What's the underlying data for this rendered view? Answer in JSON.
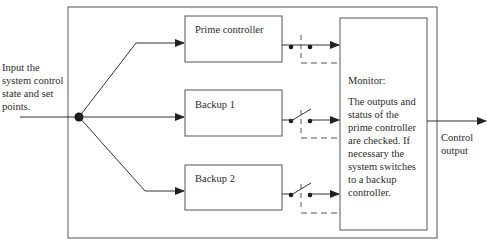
{
  "diagram": {
    "input_label": [
      "Input the",
      "system control",
      "state and set",
      "points."
    ],
    "controllers": [
      {
        "label": "Prime controller",
        "switch_state": "closed"
      },
      {
        "label": "Backup 1",
        "switch_state": "open"
      },
      {
        "label": "Backup 2",
        "switch_state": "open"
      }
    ],
    "monitor": {
      "title": "Monitor:",
      "description": [
        "The outputs and",
        "status of the",
        "prime controller",
        "are checked. If",
        "necessary the",
        "system switches",
        "to a backup",
        "controller."
      ]
    },
    "output_label": [
      "Control",
      "output"
    ],
    "colors": {
      "line": "#333333",
      "box_stroke": "#555555",
      "dashed": "#555555"
    }
  }
}
